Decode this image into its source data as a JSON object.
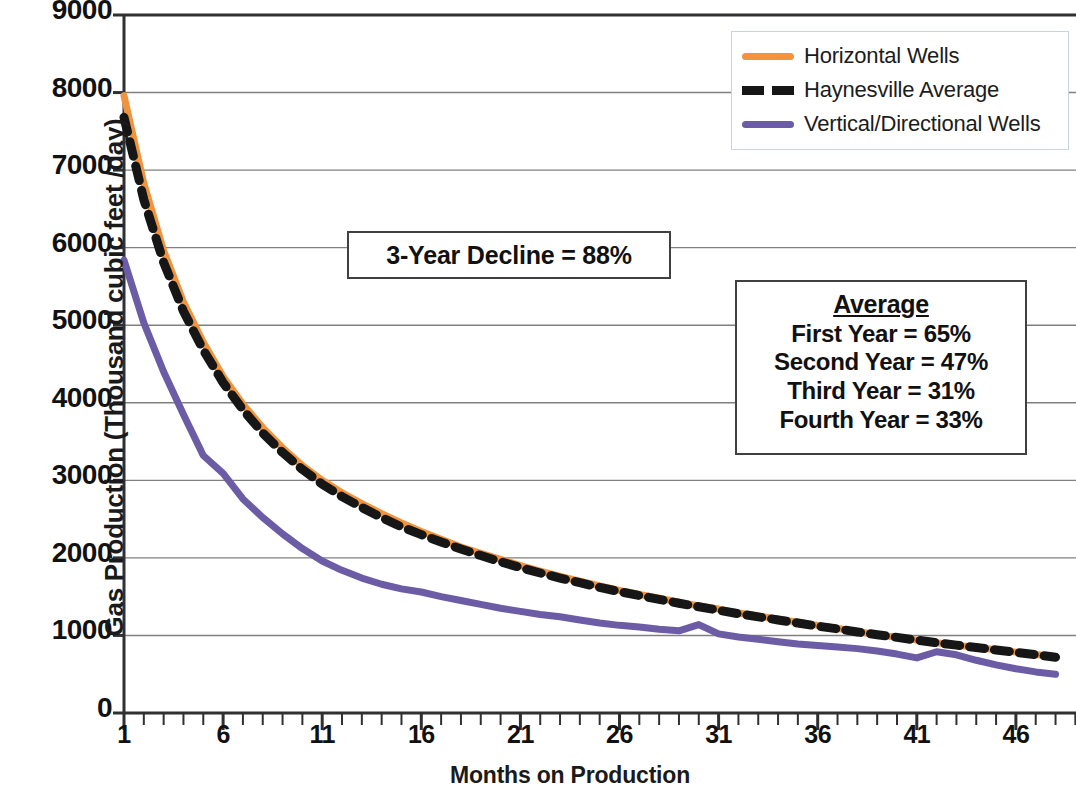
{
  "chart_data": {
    "type": "line",
    "title": "",
    "xlabel": "Months on Production",
    "ylabel": "Gas Production (Thousand cubic feet /day)",
    "xlim": [
      1,
      48
    ],
    "ylim": [
      0,
      9000
    ],
    "grid": true,
    "y_ticks": [
      0,
      1000,
      2000,
      3000,
      4000,
      5000,
      6000,
      7000,
      8000,
      9000
    ],
    "y_tick_labels": [
      "0",
      "1000",
      "2000",
      "3000",
      "4000",
      "5000",
      "6000",
      "7000",
      "8000",
      "9000"
    ],
    "x_ticks": [
      1,
      6,
      11,
      16,
      21,
      26,
      31,
      36,
      41,
      46
    ],
    "x_tick_labels": [
      "1",
      "6",
      "11",
      "16",
      "21",
      "26",
      "31",
      "36",
      "41",
      "46"
    ],
    "x_minor_tick_interval": 1,
    "legend_position": "top-right",
    "x": [
      1,
      2,
      3,
      4,
      5,
      6,
      7,
      8,
      9,
      10,
      11,
      12,
      13,
      14,
      15,
      16,
      17,
      18,
      19,
      20,
      21,
      22,
      23,
      24,
      25,
      26,
      27,
      28,
      29,
      30,
      31,
      32,
      33,
      34,
      35,
      36,
      37,
      38,
      39,
      40,
      41,
      42,
      43,
      44,
      45,
      46,
      47,
      48
    ],
    "series": [
      {
        "name": "Horizontal Wells",
        "color": "#F2943D",
        "style": "solid",
        "values": [
          7960,
          6830,
          5960,
          5300,
          4780,
          4340,
          3980,
          3680,
          3420,
          3190,
          3000,
          2840,
          2700,
          2570,
          2450,
          2340,
          2240,
          2140,
          2060,
          1980,
          1900,
          1830,
          1760,
          1700,
          1640,
          1580,
          1530,
          1480,
          1430,
          1380,
          1340,
          1290,
          1250,
          1210,
          1170,
          1130,
          1090,
          1050,
          1010,
          975,
          940,
          905,
          875,
          845,
          815,
          785,
          755,
          725
        ]
      },
      {
        "name": "Haynesville Average",
        "color": "#161616",
        "style": "dashed",
        "values": [
          7680,
          6620,
          5810,
          5180,
          4680,
          4260,
          3910,
          3610,
          3360,
          3140,
          2950,
          2790,
          2650,
          2520,
          2400,
          2300,
          2205,
          2115,
          2030,
          1950,
          1875,
          1805,
          1740,
          1680,
          1620,
          1565,
          1515,
          1465,
          1415,
          1370,
          1325,
          1280,
          1240,
          1200,
          1160,
          1120,
          1085,
          1045,
          1010,
          975,
          940,
          905,
          875,
          845,
          812,
          782,
          752,
          720
        ]
      },
      {
        "name": "Vertical/Directional Wells",
        "color": "#6C5CA6",
        "style": "solid",
        "values": [
          5840,
          5030,
          4400,
          3850,
          3320,
          3090,
          2760,
          2520,
          2310,
          2120,
          1960,
          1840,
          1740,
          1660,
          1600,
          1560,
          1500,
          1450,
          1400,
          1350,
          1310,
          1270,
          1240,
          1200,
          1160,
          1130,
          1110,
          1080,
          1060,
          1140,
          1020,
          980,
          950,
          920,
          890,
          870,
          850,
          830,
          800,
          760,
          710,
          790,
          750,
          680,
          620,
          570,
          530,
          500
        ]
      }
    ],
    "annotations": [
      {
        "name": "decline-note",
        "text": "3-Year Decline = 88%"
      },
      {
        "name": "average-note",
        "title": "Average",
        "lines": [
          "First Year = 65%",
          "Second Year = 47%",
          "Third Year = 31%",
          "Fourth Year = 33%"
        ]
      }
    ]
  },
  "axes": {
    "y_title": "Gas Production (Thousand cubic feet /day)",
    "x_title": "Months on Production"
  },
  "legend": {
    "items": [
      {
        "label": "Horizontal Wells",
        "swatch": "solid-orange"
      },
      {
        "label": "Haynesville Average",
        "swatch": "dash-black"
      },
      {
        "label": "Vertical/Directional Wells",
        "swatch": "solid-purple"
      }
    ]
  },
  "annotation_decline": {
    "text": "3-Year Decline = 88%"
  },
  "annotation_average": {
    "title": "Average",
    "line1": "First Year = 65%",
    "line2": "Second Year = 47%",
    "line3": "Third Year = 31%",
    "line4": "Fourth Year = 33%"
  },
  "colors": {
    "horizontal": "#F2943D",
    "average": "#161616",
    "vertical": "#6C5CA6",
    "grid": "#808080",
    "axis": "#303030"
  }
}
